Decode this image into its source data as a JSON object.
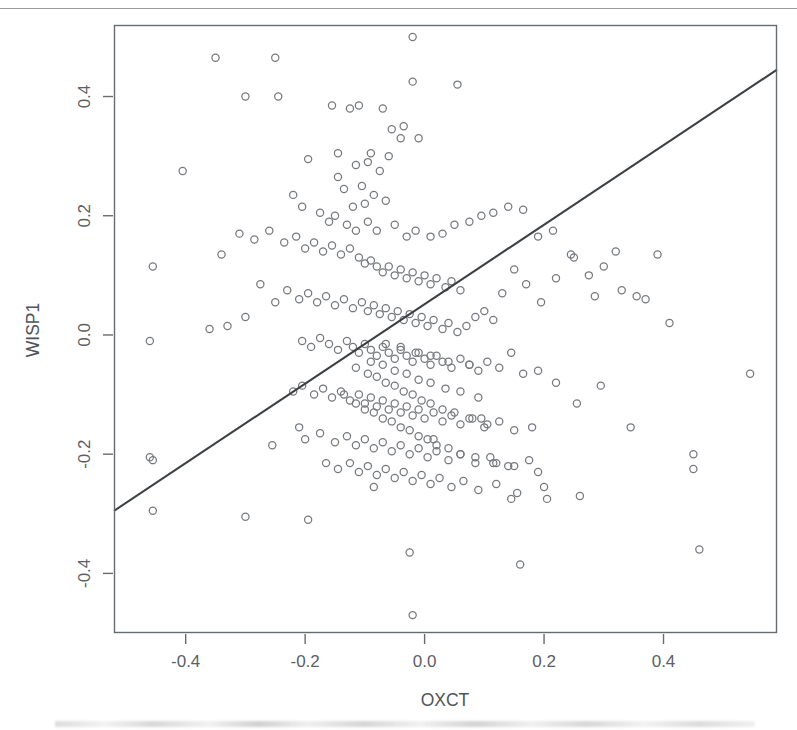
{
  "figure": {
    "kind": "scatterplot-with-regression-line",
    "background_color": "#ffffff",
    "point_color": "#76797e",
    "line_color": "#3d4043",
    "frame_color": "#666b70"
  },
  "chart_data": {
    "type": "scatter",
    "title": "",
    "subtitle": "",
    "xlabel": "OXCT",
    "ylabel": "WISP1",
    "xlim": [
      -0.52,
      0.59
    ],
    "ylim": [
      -0.5,
      0.52
    ],
    "xticks": [
      -0.4,
      -0.2,
      0.0,
      0.2,
      0.4
    ],
    "xticklabels": [
      "-0.4",
      "-0.2",
      "0.0",
      "0.2",
      "0.4"
    ],
    "yticks": [
      0.4,
      0.2,
      0.0,
      -0.2,
      -0.4
    ],
    "yticklabels": [
      "0.4",
      "0.2",
      "0.0",
      "-0.2",
      "-0.4"
    ],
    "grid": false,
    "legend": null,
    "legend_position": "none",
    "marker": "open-circle",
    "marker_size_px": 8,
    "n_points": 300,
    "annotations": [],
    "trendline": {
      "type": "linear-regression",
      "x_start": -0.52,
      "y_start": -0.295,
      "x_end": 0.59,
      "y_end": 0.445,
      "slope": 0.667,
      "intercept": 0.052
    },
    "series": [
      {
        "name": "samples",
        "x": [
          -0.02,
          -0.35,
          -0.25,
          -0.02,
          -0.3,
          -0.245,
          -0.11,
          -0.155,
          -0.07,
          -0.125,
          -0.055,
          -0.035,
          -0.04,
          -0.01,
          0.055,
          -0.145,
          -0.09,
          -0.06,
          -0.095,
          -0.405,
          -0.195,
          -0.115,
          -0.075,
          -0.145,
          -0.135,
          -0.105,
          -0.085,
          -0.12,
          -0.1,
          -0.065,
          -0.455,
          -0.22,
          -0.205,
          -0.175,
          -0.16,
          -0.15,
          -0.13,
          -0.115,
          -0.095,
          -0.08,
          -0.05,
          -0.03,
          -0.015,
          0.01,
          0.03,
          0.05,
          0.075,
          0.095,
          0.115,
          0.14,
          0.165,
          0.19,
          0.215,
          0.245,
          0.275,
          0.3,
          0.33,
          0.37,
          0.41,
          0.45,
          -0.46,
          -0.34,
          -0.31,
          -0.285,
          -0.26,
          -0.235,
          -0.215,
          -0.2,
          -0.185,
          -0.17,
          -0.155,
          -0.14,
          -0.125,
          -0.11,
          -0.1,
          -0.09,
          -0.08,
          -0.07,
          -0.06,
          -0.05,
          -0.04,
          -0.03,
          -0.02,
          -0.01,
          0.0,
          0.01,
          0.02,
          0.035,
          0.045,
          0.06,
          -0.46,
          -0.33,
          -0.3,
          -0.275,
          -0.25,
          -0.23,
          -0.21,
          -0.195,
          -0.18,
          -0.165,
          -0.15,
          -0.135,
          -0.12,
          -0.105,
          -0.095,
          -0.085,
          -0.075,
          -0.065,
          -0.055,
          -0.045,
          -0.035,
          -0.025,
          -0.015,
          -0.005,
          0.005,
          0.015,
          0.03,
          0.04,
          0.055,
          0.07,
          0.085,
          0.1,
          0.115,
          0.13,
          0.15,
          0.17,
          0.195,
          0.22,
          0.25,
          0.285,
          0.32,
          0.355,
          0.39,
          0.45,
          0.545,
          -0.455,
          -0.36,
          -0.205,
          -0.19,
          -0.175,
          -0.16,
          -0.145,
          -0.13,
          -0.12,
          -0.11,
          -0.1,
          -0.09,
          -0.08,
          -0.07,
          -0.06,
          -0.05,
          -0.04,
          -0.03,
          -0.02,
          -0.01,
          0.0,
          0.01,
          0.02,
          0.03,
          0.045,
          0.06,
          0.075,
          0.09,
          0.105,
          0.125,
          0.145,
          0.165,
          0.19,
          0.22,
          0.255,
          0.295,
          0.345,
          -0.22,
          -0.205,
          -0.185,
          -0.17,
          -0.155,
          -0.14,
          -0.125,
          -0.11,
          -0.1,
          -0.09,
          -0.08,
          -0.07,
          -0.06,
          -0.05,
          -0.04,
          -0.03,
          -0.02,
          -0.01,
          0.0,
          0.015,
          0.03,
          0.045,
          0.06,
          0.08,
          0.1,
          0.125,
          0.15,
          0.18,
          -0.2,
          -0.175,
          -0.15,
          -0.13,
          -0.115,
          -0.1,
          -0.085,
          -0.07,
          -0.055,
          -0.04,
          -0.025,
          -0.01,
          0.005,
          0.02,
          0.04,
          0.06,
          0.085,
          0.11,
          0.14,
          0.175,
          -0.165,
          -0.145,
          -0.125,
          -0.11,
          -0.095,
          -0.08,
          -0.065,
          -0.05,
          -0.035,
          -0.02,
          -0.005,
          0.01,
          0.025,
          0.045,
          0.065,
          0.09,
          0.12,
          0.155,
          0.2,
          0.26,
          -0.135,
          -0.115,
          -0.1,
          -0.085,
          -0.07,
          -0.055,
          -0.04,
          -0.025,
          -0.01,
          0.005,
          0.02,
          0.04,
          0.06,
          0.085,
          0.115,
          0.15,
          0.19,
          -0.115,
          -0.095,
          -0.08,
          -0.065,
          -0.05,
          -0.035,
          -0.02,
          -0.005,
          0.01,
          0.03,
          0.05,
          0.075,
          0.105,
          -0.09,
          -0.07,
          -0.05,
          -0.03,
          -0.01,
          0.01,
          0.035,
          0.06,
          0.09,
          -0.065,
          -0.04,
          -0.015,
          0.01,
          0.04,
          0.075,
          -0.3,
          -0.025,
          0.16,
          -0.02,
          0.145,
          -0.195,
          0.205,
          -0.085,
          0.12,
          -0.455,
          0.46,
          -0.255,
          0.015,
          -0.21,
          0.095
        ],
        "y": [
          0.5,
          0.465,
          0.465,
          0.425,
          0.4,
          0.4,
          0.385,
          0.385,
          0.38,
          0.38,
          0.345,
          0.35,
          0.33,
          0.33,
          0.42,
          0.305,
          0.305,
          0.3,
          0.29,
          0.275,
          0.295,
          0.285,
          0.275,
          0.265,
          0.245,
          0.25,
          0.235,
          0.215,
          0.22,
          0.225,
          0.115,
          0.235,
          0.215,
          0.205,
          0.19,
          0.2,
          0.185,
          0.175,
          0.19,
          0.175,
          0.185,
          0.165,
          0.175,
          0.165,
          0.17,
          0.185,
          0.19,
          0.2,
          0.205,
          0.215,
          0.21,
          0.165,
          0.175,
          0.135,
          0.1,
          0.115,
          0.075,
          0.06,
          0.02,
          -0.2,
          -0.01,
          0.135,
          0.17,
          0.16,
          0.175,
          0.155,
          0.165,
          0.145,
          0.155,
          0.14,
          0.15,
          0.135,
          0.145,
          0.13,
          0.12,
          0.125,
          0.115,
          0.105,
          0.115,
          0.1,
          0.11,
          0.095,
          0.105,
          0.09,
          0.1,
          0.085,
          0.095,
          0.08,
          0.09,
          0.075,
          -0.205,
          0.015,
          0.03,
          0.085,
          0.055,
          0.075,
          0.06,
          0.07,
          0.055,
          0.065,
          0.05,
          0.06,
          0.045,
          0.055,
          0.04,
          0.05,
          0.035,
          0.045,
          0.03,
          0.04,
          0.025,
          0.035,
          0.02,
          0.03,
          0.015,
          0.025,
          0.01,
          0.02,
          0.005,
          0.015,
          0.03,
          0.04,
          0.025,
          0.07,
          0.11,
          0.085,
          0.055,
          0.095,
          0.13,
          0.065,
          0.14,
          0.065,
          0.135,
          -0.225,
          -0.065,
          -0.295,
          0.01,
          -0.01,
          -0.02,
          -0.005,
          -0.015,
          -0.025,
          -0.01,
          -0.02,
          -0.03,
          -0.015,
          -0.025,
          -0.035,
          -0.02,
          -0.03,
          -0.04,
          -0.025,
          -0.035,
          -0.045,
          -0.03,
          -0.04,
          -0.05,
          -0.035,
          -0.045,
          -0.055,
          -0.04,
          -0.05,
          -0.06,
          -0.045,
          -0.055,
          -0.03,
          -0.065,
          -0.06,
          -0.08,
          -0.115,
          -0.085,
          -0.155,
          -0.095,
          -0.085,
          -0.1,
          -0.09,
          -0.105,
          -0.095,
          -0.11,
          -0.1,
          -0.115,
          -0.105,
          -0.12,
          -0.11,
          -0.125,
          -0.115,
          -0.13,
          -0.12,
          -0.135,
          -0.125,
          -0.14,
          -0.13,
          -0.145,
          -0.135,
          -0.15,
          -0.14,
          -0.155,
          -0.145,
          -0.16,
          -0.155,
          -0.175,
          -0.165,
          -0.18,
          -0.17,
          -0.185,
          -0.175,
          -0.19,
          -0.18,
          -0.195,
          -0.185,
          -0.2,
          -0.19,
          -0.205,
          -0.195,
          -0.21,
          -0.2,
          -0.215,
          -0.205,
          -0.22,
          -0.21,
          -0.215,
          -0.225,
          -0.215,
          -0.23,
          -0.22,
          -0.235,
          -0.225,
          -0.24,
          -0.23,
          -0.245,
          -0.235,
          -0.25,
          -0.24,
          -0.255,
          -0.245,
          -0.26,
          -0.25,
          -0.265,
          -0.255,
          -0.27,
          -0.1,
          -0.115,
          -0.125,
          -0.13,
          -0.14,
          -0.145,
          -0.155,
          -0.16,
          -0.17,
          -0.175,
          -0.185,
          -0.19,
          -0.2,
          -0.205,
          -0.215,
          -0.22,
          -0.23,
          -0.055,
          -0.065,
          -0.07,
          -0.08,
          -0.085,
          -0.095,
          -0.1,
          -0.11,
          -0.115,
          -0.125,
          -0.13,
          -0.14,
          -0.15,
          -0.045,
          -0.05,
          -0.06,
          -0.065,
          -0.075,
          -0.08,
          -0.09,
          -0.095,
          -0.105,
          -0.015,
          -0.02,
          -0.03,
          -0.035,
          -0.045,
          -0.05,
          -0.305,
          -0.365,
          -0.385,
          -0.47,
          -0.275,
          -0.31,
          -0.275,
          -0.255,
          -0.215,
          -0.21,
          -0.36,
          -0.185,
          -0.175,
          -0.155,
          -0.14
        ]
      }
    ]
  },
  "axes": {
    "x_title": "OXCT",
    "y_title": "WISP1"
  }
}
